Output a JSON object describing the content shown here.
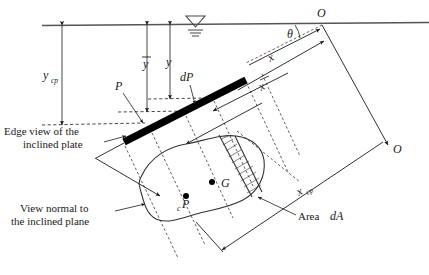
{
  "figure": {
    "type": "engineering-diagram",
    "background_color": "#ffffff",
    "line_color": "#1a1a1a",
    "plate_color": "#000000"
  },
  "labels": {
    "y_cp": "y",
    "y_cp_sub": "cp",
    "y_bar": "y",
    "y": "y",
    "P": "P",
    "dP": "dP",
    "theta": "θ",
    "O_top": "O",
    "O_bottom": "O",
    "x_top": "x",
    "x_bar": "x",
    "x_cp": "x",
    "x_cp_sub": "cp",
    "G": "G",
    "cP": "cP",
    "cP_c": "c",
    "cP_P": "P",
    "edge_view_line1": "Edge view of the",
    "edge_view_line2": "inclined plate",
    "view_normal_line1": "View normal to",
    "view_normal_line2": "the inclined plane",
    "area_dA_text": "Area ",
    "area_dA_italic": "dA",
    "free_surface_icon": "free-surface-symbol"
  },
  "geometry": {
    "free_surface_y": 25,
    "plate_start": [
      124,
      141
    ],
    "plate_end": [
      245,
      80
    ],
    "origin_O_top": [
      322,
      25
    ],
    "origin_O_bottom": [
      388,
      145
    ],
    "theta_degrees": 27,
    "centroid_G": [
      212,
      182
    ],
    "center_of_pressure_cP": [
      186,
      196
    ]
  }
}
